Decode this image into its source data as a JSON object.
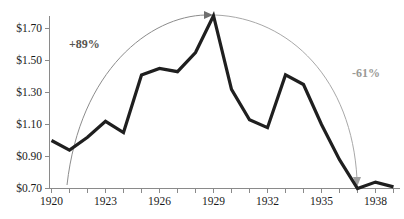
{
  "chart_data": {
    "type": "line",
    "title": "",
    "subtitle": "",
    "xlabel": "",
    "ylabel": "",
    "grid": false,
    "legend": "none",
    "xlim": [
      1920,
      1939
    ],
    "ylim": [
      0.7,
      1.8
    ],
    "x": [
      1920,
      1921,
      1922,
      1923,
      1924,
      1925,
      1926,
      1927,
      1928,
      1929,
      1930,
      1931,
      1932,
      1933,
      1934,
      1935,
      1936,
      1937,
      1938,
      1939
    ],
    "values": [
      1.0,
      0.94,
      1.02,
      1.12,
      1.05,
      1.41,
      1.45,
      1.43,
      1.55,
      1.78,
      1.32,
      1.13,
      1.08,
      1.41,
      1.35,
      1.1,
      0.88,
      0.7,
      0.74,
      0.71
    ],
    "series": [
      {
        "name": "price",
        "values": [
          1.0,
          0.94,
          1.02,
          1.12,
          1.05,
          1.41,
          1.45,
          1.43,
          1.55,
          1.78,
          1.32,
          1.13,
          1.08,
          1.41,
          1.35,
          1.1,
          0.88,
          0.7,
          0.74,
          0.71
        ]
      }
    ],
    "ytick_labels": [
      "$1.70",
      "$1.50",
      "$1.30",
      "$1.10",
      "$0.90",
      "$0.70"
    ],
    "ytick_values": [
      1.7,
      1.5,
      1.3,
      1.1,
      0.9,
      0.7
    ],
    "xtick_labels": [
      "1920",
      "1923",
      "1926",
      "1929",
      "1932",
      "1935",
      "1938"
    ],
    "xtick_values": [
      1920,
      1923,
      1926,
      1929,
      1932,
      1935,
      1938
    ],
    "annotations": [
      {
        "label": "+89%",
        "from_year": 1921,
        "to_year": 1929,
        "direction": "up",
        "color": "#55544f"
      },
      {
        "label": "-61%",
        "from_year": 1929,
        "to_year": 1937,
        "direction": "down",
        "color": "#9a9a96"
      }
    ],
    "line_color": "#1f1f1f",
    "axis_color": "#808080",
    "arc_color": "#8c8c8c"
  }
}
